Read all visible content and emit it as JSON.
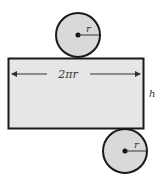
{
  "diagram": {
    "top_circle": {
      "radius_label": "r"
    },
    "rectangle": {
      "width_label": "2πr",
      "height_label": "h"
    },
    "bottom_circle": {
      "radius_label": "r"
    },
    "colors": {
      "fill": "#d9d9d9",
      "stroke": "#1a1a1a",
      "background": "#ffffff"
    }
  }
}
